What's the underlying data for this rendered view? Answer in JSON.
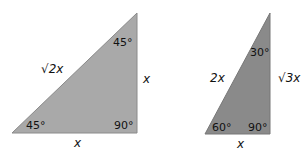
{
  "colors": {
    "tri1_fill": "#a9a9a9",
    "tri2_fill": "#8a8a8a",
    "stroke": "#7a7a7a"
  },
  "triangle_45": {
    "angle_top": "45°",
    "angle_bottom_left": "45°",
    "angle_right": "90°",
    "hypotenuse": "√2x",
    "vertical_side": "x",
    "base": "x"
  },
  "triangle_30": {
    "angle_top": "30°",
    "angle_bottom_left": "60°",
    "angle_right": "90°",
    "hypotenuse": "2x",
    "vertical_side": "√3x",
    "base": "x"
  }
}
